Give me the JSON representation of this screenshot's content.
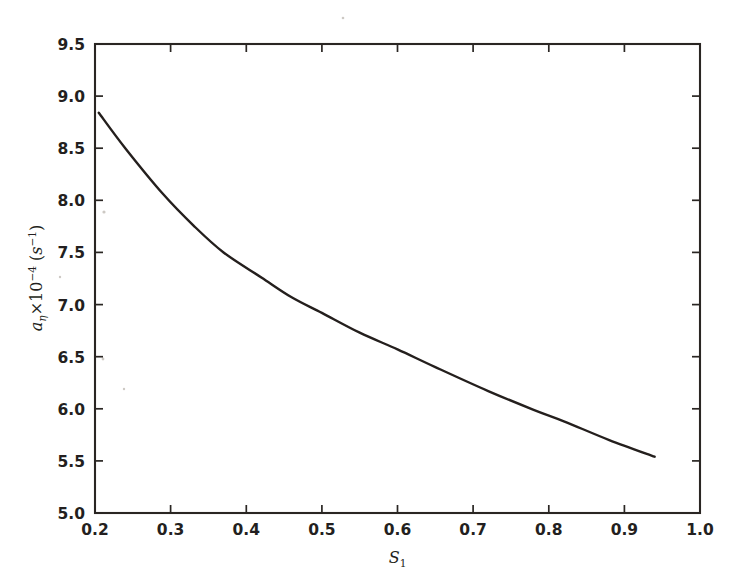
{
  "figure": {
    "background_color": "#ffffff",
    "ink_color": "#241f1d",
    "width": 746,
    "height": 581
  },
  "chart_data": {
    "type": "line",
    "title": "",
    "subtitle": "",
    "xlabel": "S_1",
    "xlabel_base": "S",
    "xlabel_sub": "1",
    "ylabel": "a_η × 10^-4 (s^-1)",
    "ylabel_base": "a",
    "ylabel_sub": "η",
    "ylabel_times": "×10",
    "ylabel_exp": "−4",
    "ylabel_units_open": " (",
    "ylabel_units_var": "s",
    "ylabel_units_exp": "−1",
    "ylabel_units_close": ")",
    "xlim": [
      0.2,
      1.0
    ],
    "ylim": [
      5.0,
      9.5
    ],
    "xticks": [
      0.2,
      0.3,
      0.4,
      0.5,
      0.6,
      0.7,
      0.8,
      0.9,
      1.0
    ],
    "xtick_labels": [
      "0.2",
      "0.3",
      "0.4",
      "0.5",
      "0.6",
      "0.7",
      "0.8",
      "0.9",
      "1.0"
    ],
    "yticks": [
      5.0,
      5.5,
      6.0,
      6.5,
      7.0,
      7.5,
      8.0,
      8.5,
      9.0,
      9.5
    ],
    "ytick_labels": [
      "5.0",
      "5.5",
      "6.0",
      "6.5",
      "7.0",
      "7.5",
      "8.0",
      "8.5",
      "9.0",
      "9.5"
    ],
    "grid": false,
    "legend": null,
    "legend_position": "none",
    "series": [
      {
        "name": "a_eta vs S1",
        "color": "#241f1d",
        "linestyle": "solid",
        "linewidth": 2.4,
        "x": [
          0.205,
          0.24,
          0.29,
          0.33,
          0.37,
          0.42,
          0.46,
          0.5,
          0.55,
          0.6,
          0.65,
          0.72,
          0.78,
          0.82,
          0.88,
          0.94
        ],
        "y": [
          8.84,
          8.5,
          8.06,
          7.76,
          7.5,
          7.26,
          7.07,
          6.92,
          6.73,
          6.57,
          6.4,
          6.17,
          5.99,
          5.88,
          5.7,
          5.54
        ]
      }
    ],
    "annotations": []
  },
  "axes": {
    "frame": {
      "left_px": 95,
      "right_px": 700,
      "top_px": 44,
      "bottom_px": 513
    },
    "spine_color": "#2a2623",
    "tick_direction": "in"
  }
}
